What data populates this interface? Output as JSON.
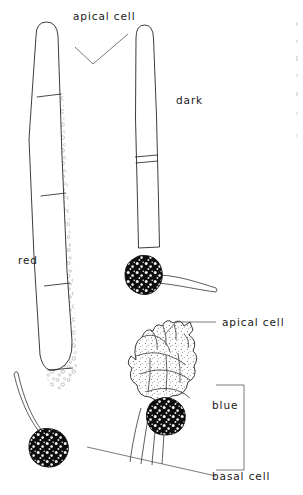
{
  "figure": {
    "type": "scientific-line-drawing",
    "background_color": "#ffffff",
    "ink_color": "#202020"
  },
  "labels": {
    "apical_cell_top": "apical cell",
    "apical_cell_right": "apical cell",
    "basal_cell": "basal cell",
    "treatment_red": "red",
    "treatment_dark": "dark",
    "treatment_blue": "blue"
  },
  "specimens": [
    {
      "id": "red-filament",
      "treatment_label": "red",
      "description": "long slender uniseriate filament, widest of the three, stippled apical cell, several cross walls, curved base ending in dark basal cell with rhizoid",
      "apex_texture": "dense stipple",
      "basal_cell_fill": "black",
      "has_rhizoid": true
    },
    {
      "id": "dark-filament",
      "treatment_label": "dark",
      "description": "narrow elongate filament, stippled apex, one prominent cross wall, dark rounded basal cell with rhizoid extending to the right",
      "apex_texture": "dense stipple",
      "basal_cell_fill": "black",
      "has_rhizoid": true
    },
    {
      "id": "blue-cluster",
      "treatment_label": "blue",
      "description": "compact multicellular cluster of swollen stippled polygonal cells with short apical projections, dark basal cell with several fine rhizoids",
      "apex_texture": "stippled polygonal cells",
      "basal_cell_fill": "black",
      "has_rhizoid": true
    }
  ],
  "annotations": [
    {
      "label": "apical cell",
      "points_to": "red-filament apex"
    },
    {
      "label": "apical cell",
      "points_to": "blue-cluster apex"
    },
    {
      "label": "basal cell",
      "points_to": "red-filament base and blue-cluster base"
    },
    {
      "label": "blue",
      "points_to": "blue-cluster"
    }
  ]
}
